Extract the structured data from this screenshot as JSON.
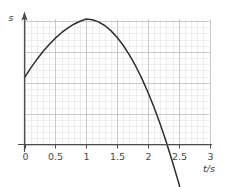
{
  "chart_data": {
    "type": "line",
    "title": "",
    "subtitle": "",
    "xlabel": "t/s",
    "ylabel": "s",
    "xlim": [
      0,
      3
    ],
    "ylim": [
      -0.12,
      1.08
    ],
    "x_ticks": [
      "0",
      "0.5",
      "1",
      "1.5",
      "2",
      "2.5",
      "3"
    ],
    "x_tick_values": [
      0,
      0.5,
      1,
      1.5,
      2,
      2.5,
      3
    ],
    "y_ticks": [],
    "grid": "minor grid every 0.1 s, major grid every 0.5 s",
    "grid_minor_step": 0.1,
    "grid_major_step": 0.5,
    "legend": "none",
    "annotations": [],
    "series": [
      {
        "name": "s(t)",
        "description": "downward parabola, rises from a positive intercept, peaks near t = 1 s, falls through zero just after t = 2.5 s",
        "x": [
          0,
          0.1,
          0.2,
          0.3,
          0.4,
          0.5,
          0.6,
          0.7,
          0.8,
          0.9,
          1.0,
          1.1,
          1.2,
          1.3,
          1.4,
          1.5,
          1.6,
          1.7,
          1.8,
          1.9,
          2.0,
          2.1,
          2.2,
          2.3,
          2.4,
          2.5,
          2.55,
          2.6,
          2.65
        ],
        "values": [
          0.575,
          0.657,
          0.732,
          0.8,
          0.861,
          0.915,
          0.962,
          1.002,
          1.035,
          1.061,
          1.08,
          1.074,
          1.055,
          1.024,
          0.98,
          0.923,
          0.854,
          0.772,
          0.678,
          0.571,
          0.452,
          0.32,
          0.176,
          0.019,
          -0.15,
          -0.33,
          -0.43,
          -0.53,
          -0.63
        ]
      }
    ],
    "curve_features": {
      "y_intercept": 0.575,
      "peak_t": 1.0,
      "peak_s": 1.08,
      "zero_crossing_t": 2.3
    }
  },
  "axes": {
    "y_axis_label": "s",
    "x_axis_label": "t/s",
    "arrow_y": "up-arrow",
    "arrow_x": "none"
  },
  "colors": {
    "curve": "#2f2f2f",
    "axis": "#4d4d4d",
    "grid_minor": "#e4e4e4",
    "grid_major": "#b9b9b9",
    "text": "#4a4a4a",
    "background": "#ffffff"
  }
}
